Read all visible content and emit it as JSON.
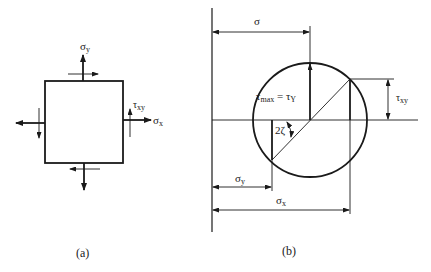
{
  "figure": {
    "panel_a": {
      "caption": "(a)",
      "labels": {
        "sigma_y": "σ",
        "sigma_y_sub": "y",
        "sigma_x": "σ",
        "sigma_x_sub": "x",
        "tau_xy": "τ",
        "tau_xy_sub": "xy"
      }
    },
    "panel_b": {
      "caption": "(b)",
      "labels": {
        "sigma": "σ",
        "tau_max": "τ",
        "tau_max_sub": "max",
        "equals": " = ",
        "tau_Y": "τ",
        "tau_Y_sub": "Y",
        "tau_xy": "τ",
        "tau_xy_sub": "xy",
        "two_zeta": "2ζ",
        "sigma_y": "σ",
        "sigma_y_sub": "y",
        "sigma_x": "σ",
        "sigma_x_sub": "x"
      }
    }
  }
}
